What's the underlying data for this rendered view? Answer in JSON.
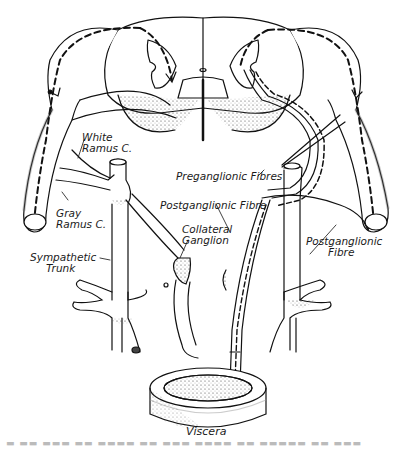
{
  "figure": {
    "colors": {
      "ink": "#111111",
      "background": "#ffffff",
      "stipple": "#555555"
    },
    "labels": {
      "white_ramus": [
        "White",
        "Ramus C."
      ],
      "gray_ramus": [
        "Gray",
        "Ramus C."
      ],
      "sympathetic_trunk": [
        "Sympathetic",
        "Trunk"
      ],
      "collateral_ganglion": [
        "Collateral",
        "Ganglion"
      ],
      "preganglionic_fibres": "Preganglionic Fibres",
      "postganglionic_fibre_center": "Postganglionic Fibre",
      "postganglionic_fibre_right": [
        "Postganglionic",
        "Fibre"
      ],
      "viscera": "Viscera"
    },
    "caption": "Fig. (illegible, cropped caption)"
  }
}
